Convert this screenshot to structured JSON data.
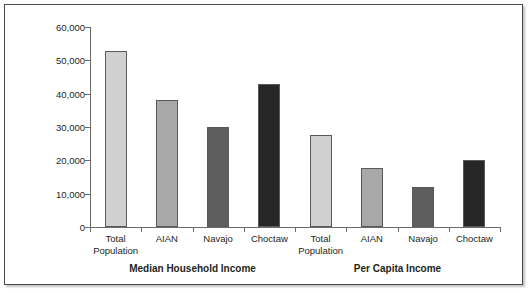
{
  "chart_data": {
    "type": "bar",
    "title": "",
    "subtitle": "",
    "xlabel": "",
    "ylabel": "",
    "ylim": [
      0,
      60000
    ],
    "y_ticks": [
      "0",
      "10,000",
      "20,000",
      "30,000",
      "40,000",
      "50,000",
      "60,000"
    ],
    "y_tick_values": [
      0,
      10000,
      20000,
      30000,
      40000,
      50000,
      60000
    ],
    "grid": false,
    "legend": "none",
    "categories": [
      "Total Population",
      "AIAN",
      "Navajo",
      "Choctaw"
    ],
    "groups": [
      {
        "name": "Median Household Income",
        "label": "Median Household Income",
        "bars": [
          {
            "category": "Total Population",
            "label_line1": "Total",
            "label_line2": "Population",
            "value": 52800,
            "color": "#d0d0d0"
          },
          {
            "category": "AIAN",
            "label_line1": "AIAN",
            "label_line2": "",
            "value": 38100,
            "color": "#a8a8a8"
          },
          {
            "category": "Navajo",
            "label_line1": "Navajo",
            "label_line2": "",
            "value": 30000,
            "color": "#5e5e5e"
          },
          {
            "category": "Choctaw",
            "label_line1": "Choctaw",
            "label_line2": "",
            "value": 42900,
            "color": "#262626"
          }
        ]
      },
      {
        "name": "Per Capita Income",
        "label": "Per Capita Income",
        "bars": [
          {
            "category": "Total Population",
            "label_line1": "Total",
            "label_line2": "Population",
            "value": 27600,
            "color": "#d0d0d0"
          },
          {
            "category": "AIAN",
            "label_line1": "AIAN",
            "label_line2": "",
            "value": 17600,
            "color": "#a8a8a8"
          },
          {
            "category": "Navajo",
            "label_line1": "Navajo",
            "label_line2": "",
            "value": 12000,
            "color": "#5e5e5e"
          },
          {
            "category": "Choctaw",
            "label_line1": "Choctaw",
            "label_line2": "",
            "value": 20100,
            "color": "#262626"
          }
        ]
      }
    ],
    "series": [
      {
        "name": "Median Household Income",
        "values": [
          52800,
          38100,
          30000,
          42900
        ]
      },
      {
        "name": "Per Capita Income",
        "values": [
          27600,
          17600,
          12000,
          20100
        ]
      }
    ],
    "colors": {
      "total_population": "#d0d0d0",
      "aian": "#a8a8a8",
      "navajo": "#5e5e5e",
      "choctaw": "#262626",
      "axis": "#6b6b6b",
      "bar_outline": "#58595b",
      "frame": "#4a4a4a",
      "text": "#231f20",
      "background": "#ffffff"
    }
  }
}
